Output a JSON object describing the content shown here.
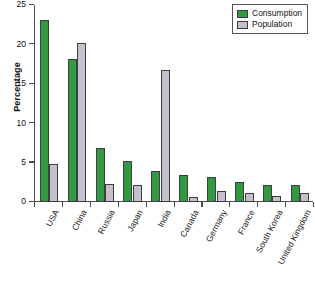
{
  "chart_data": {
    "type": "bar",
    "title": "",
    "xlabel": "",
    "ylabel": "Percentage",
    "ylim": [
      0,
      25
    ],
    "yticks": [
      0,
      5,
      10,
      15,
      20,
      25
    ],
    "ytick_labels": [
      "0",
      "5",
      "10",
      "15",
      "20",
      "25"
    ],
    "grid": false,
    "legend_position": "top-right",
    "categories": [
      "USA",
      "China",
      "Russia",
      "Japan",
      "India",
      "Canada",
      "Germany",
      "France",
      "South Korea",
      "United Kingdom"
    ],
    "series": [
      {
        "name": "Consumption",
        "color": "#2f9b3e",
        "values": [
          23.1,
          18.2,
          6.9,
          5.2,
          3.9,
          3.4,
          3.2,
          2.6,
          2.2,
          2.2
        ]
      },
      {
        "name": "Population",
        "color": "#c6c0cb",
        "values": [
          4.8,
          20.2,
          2.3,
          2.1,
          16.8,
          0.6,
          1.4,
          1.1,
          0.8,
          1.1
        ]
      }
    ]
  },
  "legend": {
    "items": [
      {
        "label": "Consumption",
        "swatch": "consumption"
      },
      {
        "label": "Population",
        "swatch": "population"
      }
    ]
  }
}
